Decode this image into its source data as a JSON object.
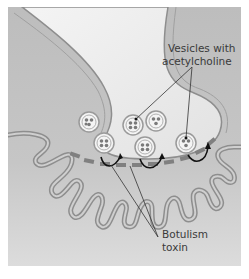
{
  "diagram": {
    "labels": {
      "vesicles_line1": "Vesicles with",
      "vesicles_line2": "acetylcholine",
      "toxin_line1": "Botulism",
      "toxin_line2": "toxin"
    },
    "colors": {
      "background_top": "#bdbdbd",
      "background_bottom": "#d9d9d9",
      "axon_fill": "#efefef",
      "membrane": "#8e8e8e",
      "vesicle": "#9a9a9a",
      "toxin_block": "#7f7f7f",
      "arrow": "#111111",
      "leader_line": "#333333"
    }
  }
}
